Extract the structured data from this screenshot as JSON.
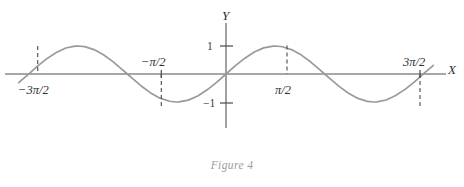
{
  "figure": {
    "caption": "Figure 4",
    "axis_x_label": "X",
    "axis_y_label": "Y"
  },
  "labels": {
    "neg_three_pi_over_two": "−3π/2",
    "neg_pi_over_two": "−π/2",
    "pi_over_two": "π/2",
    "three_pi_over_two": "3π/2",
    "y_one": "1",
    "y_neg_one": "−1"
  },
  "colors": {
    "curve": "#9a9a9a",
    "axis": "#8a8a8a",
    "dash": "#4a4a4a",
    "text": "#2e2e2e",
    "caption": "#9b9b9b",
    "background": "#ffffff"
  },
  "chart_data": {
    "type": "line",
    "title": "Figure 4",
    "xlabel": "X",
    "ylabel": "Y",
    "function": "y = sin(x)",
    "grid": false,
    "legend": false,
    "xlim": [
      -6.6,
      6.9
    ],
    "ylim": [
      -1.35,
      1.45
    ],
    "x_ticks": [
      -4.71238898038469,
      -1.570796326794897,
      1.570796326794897,
      4.71238898038469
    ],
    "x_tick_labels": [
      "−3π/2",
      "−π/2",
      "π/2",
      "3π/2"
    ],
    "y_ticks": [
      -1,
      1
    ],
    "y_tick_labels": [
      "−1",
      "1"
    ],
    "x": [
      -6.6,
      -6.3,
      -6.0,
      -5.7,
      -5.4,
      -5.1,
      -4.8,
      -4.71,
      -4.5,
      -4.2,
      -3.9,
      -3.6,
      -3.3,
      -3.14,
      -3.0,
      -2.7,
      -2.4,
      -2.1,
      -1.8,
      -1.57,
      -1.5,
      -1.2,
      -0.9,
      -0.6,
      -0.3,
      0.0,
      0.3,
      0.6,
      0.9,
      1.2,
      1.5,
      1.57,
      1.8,
      2.1,
      2.4,
      2.7,
      3.0,
      3.14,
      3.3,
      3.6,
      3.9,
      4.2,
      4.5,
      4.71,
      4.8,
      5.1,
      5.4,
      5.7,
      6.0,
      6.3,
      6.6,
      6.9
    ],
    "y": [
      -0.31,
      -0.02,
      0.28,
      0.55,
      0.77,
      0.93,
      0.996,
      1.0,
      0.978,
      0.872,
      0.688,
      0.443,
      0.158,
      0.0,
      -0.141,
      -0.427,
      -0.675,
      -0.863,
      -0.974,
      -1.0,
      -0.997,
      -0.932,
      -0.783,
      -0.565,
      -0.296,
      0.0,
      0.296,
      0.565,
      0.783,
      0.932,
      0.997,
      1.0,
      0.974,
      0.863,
      0.675,
      0.427,
      0.141,
      0.0,
      -0.158,
      -0.443,
      -0.688,
      -0.872,
      -0.978,
      -1.0,
      -0.996,
      -0.93,
      -0.77,
      -0.55,
      -0.28,
      0.02,
      0.31,
      0.58
    ],
    "annotations": [
      {
        "label": "−3π/2",
        "x": -4.71238898038469,
        "y": 0,
        "marker": "dashed-drop-to-peak"
      },
      {
        "label": "−π/2",
        "x": -1.570796326794897,
        "y": 0,
        "marker": "dashed-drop-to-trough"
      },
      {
        "label": "π/2",
        "x": 1.570796326794897,
        "y": 0,
        "marker": "dashed-drop-to-peak"
      },
      {
        "label": "3π/2",
        "x": 4.71238898038469,
        "y": 0,
        "marker": "dashed-drop-to-trough"
      }
    ]
  }
}
